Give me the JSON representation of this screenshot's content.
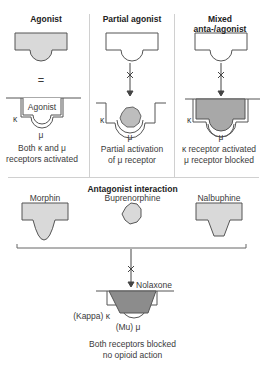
{
  "panels": [
    {
      "title": "Agonist",
      "equals_sign": "=",
      "bound_label": "Agonist",
      "kappa_label": "κ",
      "mu_label": "μ",
      "caption": [
        "Both κ and μ",
        "receptors activated"
      ]
    },
    {
      "title": "Partial agonist",
      "kappa_label": "κ",
      "mu_label": "μ",
      "caption": [
        "Partial activation",
        "of μ receptor"
      ]
    },
    {
      "title": [
        "Mixed",
        "anta-/agonist"
      ],
      "kappa_label": "κ",
      "mu_label": "μ",
      "caption": [
        "κ receptor activated",
        "μ receptor blocked"
      ]
    }
  ],
  "antagonist": {
    "title": "Antagonist interaction",
    "drugs": [
      "Morphin",
      "Buprenorphine",
      "Nalbuphine"
    ],
    "blocker_label": "Nolaxone",
    "kappa_label": "(Kappa) κ",
    "mu_label": "(Mu) μ",
    "caption": [
      "Both receptors blocked",
      "no opioid action"
    ]
  },
  "colors": {
    "line": "#555555",
    "fill_light": "#d9d9d9",
    "fill_dark": "#8c8c8c",
    "grid": "#cccccc"
  }
}
